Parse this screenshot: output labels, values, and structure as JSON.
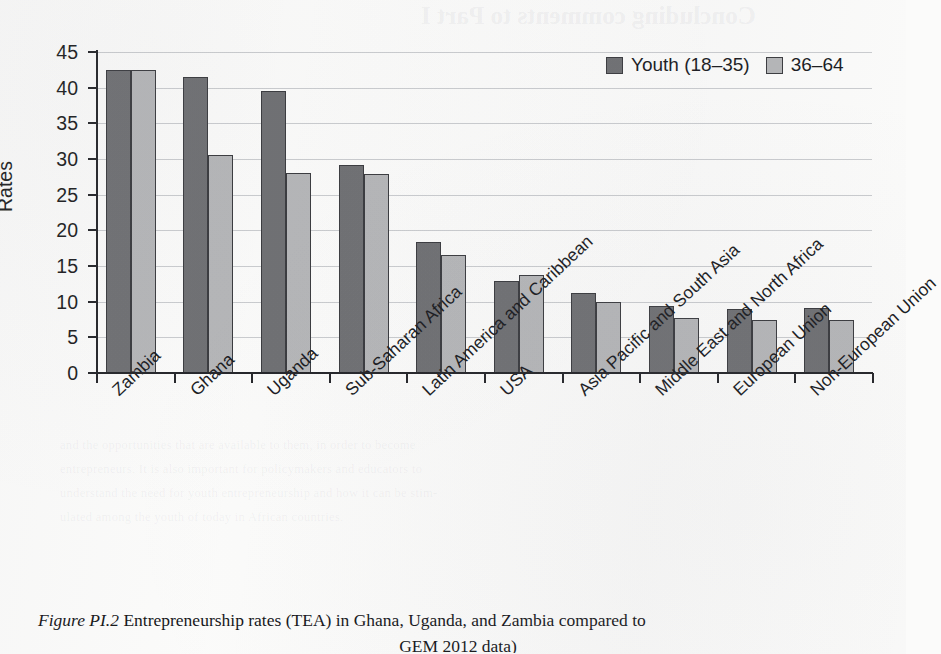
{
  "chart_data": {
    "type": "bar",
    "title": "",
    "xlabel": "",
    "ylabel": "Rates",
    "ylim": [
      0,
      45
    ],
    "ytick_step": 5,
    "yticks": [
      0,
      5,
      10,
      15,
      20,
      25,
      30,
      35,
      40,
      45
    ],
    "grid": true,
    "legend_position": "top-right",
    "categories": [
      "Zambia",
      "Ghana",
      "Uganda",
      "Sub-Saharan Africa",
      "Latin America and Caribbean",
      "USA",
      "Asia Pacific and South Asia",
      "Middle East and North Africa",
      "European Union",
      "Non-European Union"
    ],
    "series": [
      {
        "name": "Youth (18–35)",
        "color": "#6f7073",
        "values": [
          42.5,
          41.5,
          39.5,
          29.2,
          18.3,
          12.9,
          11.2,
          9.4,
          9.0,
          9.1
        ]
      },
      {
        "name": "36–64",
        "color": "#b5b6b8",
        "values": [
          42.5,
          30.5,
          28.1,
          27.9,
          16.6,
          13.8,
          9.9,
          7.7,
          7.4,
          7.5
        ]
      }
    ]
  },
  "legend": {
    "items": [
      {
        "label": "Youth (18–35)",
        "swatch": "dark"
      },
      {
        "label": "36–64",
        "swatch": "light"
      }
    ]
  },
  "caption": {
    "figure_number": "Figure PI.2",
    "text": "Entrepreneurship rates (TEA) in Ghana, Uganda, and Zambia compared to",
    "line2": "GEM 2012 data)"
  },
  "bleed_through": {
    "title": "Concluding comments to Part I",
    "lines": [
      "and the opportunities that are available to them, in order to become",
      "entrepreneurs. It is also important for policymakers and educators to",
      "understand the need for youth entrepreneurship and how it can be stim-",
      "ulated among the youth of today in African countries."
    ]
  }
}
